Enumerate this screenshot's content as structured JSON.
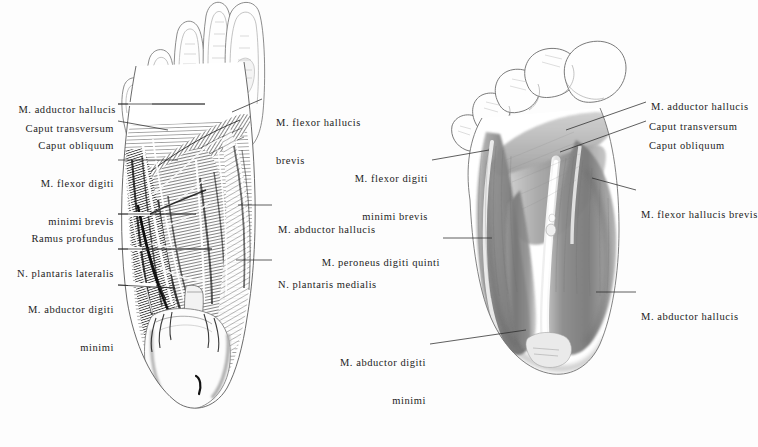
{
  "plate": {
    "title": "Plantar foot musculature — two dissection views",
    "background_color": "#fdfdfd",
    "ink_color": "#1c1c1c",
    "figure_count": 2
  },
  "figures": [
    {
      "name": "left-figure",
      "description": "Deep dissection of the plantar aspect of the right foot, toes uppermost, showing adductor hallucis, flexor digiti minimi brevis, plantar nerves and abductor hallucis",
      "style": "fine pen-and-ink hatching, high contrast"
    },
    {
      "name": "right-figure",
      "description": "Superficial plantar musculature of the foot, toes uppermost, showing flexor hallucis brevis, abductor hallucis and abductor digiti minimi in smooth grey wash",
      "style": "soft graphite wash, mid grey tones"
    }
  ],
  "labels": {
    "left_figure_left_column": [
      {
        "id": "m-adductor-hallucis-left",
        "line1": "M. adductor hallucis",
        "line2": "",
        "has_leader": false
      },
      {
        "id": "caput-transversum-left",
        "line1": "Caput transversum",
        "line2": "",
        "has_leader": true
      },
      {
        "id": "caput-obliquum-left",
        "line1": "Caput obliquum",
        "line2": "",
        "has_leader": true
      },
      {
        "id": "m-flexor-digiti-minimi-brevis-left",
        "line1": "M. flexor digiti",
        "line2": "minimi brevis",
        "has_leader": true
      },
      {
        "id": "ramus-profundus-left",
        "line1": "Ramus profundus",
        "line2": "",
        "has_leader": true
      },
      {
        "id": "n-plantaris-lateralis-left",
        "line1": "N. plantaris lateralis",
        "line2": "",
        "has_leader": true
      },
      {
        "id": "m-abductor-digiti-minimi-left",
        "line1": "M. abductor digiti",
        "line2": "minimi",
        "has_leader": true
      }
    ],
    "left_figure_right_column": [
      {
        "id": "m-flexor-hallucis-brevis-left",
        "line1": "M. flexor hallucis",
        "line2": "brevis",
        "has_leader": true
      },
      {
        "id": "m-abductor-hallucis-left",
        "line1": "M. abductor hallucis",
        "line2": "",
        "has_leader": true
      },
      {
        "id": "n-plantaris-medialis-left",
        "line1": "N. plantaris medialis",
        "line2": "",
        "has_leader": true
      }
    ],
    "right_figure_left_column": [
      {
        "id": "m-flexor-digiti-minimi-brevis-right",
        "line1": "M. flexor digiti",
        "line2": "minimi brevis",
        "has_leader": true
      },
      {
        "id": "m-peroneus-digiti-quinti-right",
        "line1": "M. peroneus digiti quinti",
        "line2": "",
        "has_leader": true
      },
      {
        "id": "m-abductor-digiti-minimi-right",
        "line1": "M. abductor digiti",
        "line2": "minimi",
        "has_leader": true
      }
    ],
    "right_figure_right_column": [
      {
        "id": "m-adductor-hallucis-right",
        "line1": "M. adductor hallucis",
        "line2": "",
        "has_leader": false
      },
      {
        "id": "caput-transversum-right",
        "line1": "Caput transversum",
        "line2": "",
        "has_leader": true
      },
      {
        "id": "caput-obliquum-right",
        "line1": "Caput obliquum",
        "line2": "",
        "has_leader": true
      },
      {
        "id": "m-flexor-hallucis-brevis-right",
        "line1": "M. flexor hallucis brevis",
        "line2": "",
        "has_leader": true
      },
      {
        "id": "m-abductor-hallucis-right",
        "line1": "M. abductor hallucis",
        "line2": "",
        "has_leader": true
      }
    ]
  }
}
